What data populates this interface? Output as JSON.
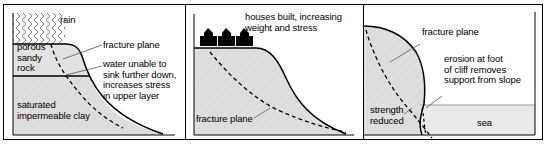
{
  "figure": {
    "panel_count": 3,
    "colors": {
      "rock_fill": "#e0e0e0",
      "clay_fill": "#dddddd",
      "sea_fill": "#e8e8e8",
      "outline": "#000000",
      "house": "#000000",
      "leader_line": "#555555",
      "background": "#ffffff"
    }
  },
  "panel1": {
    "name": "rain-infiltration",
    "labels": {
      "rain": "rain",
      "porous_sandy_rock": "porous\nsandy\nrock",
      "saturated_impermeable_clay": "saturated\nimpermeable clay",
      "fracture_plane": "fracture plane",
      "water_unable": "water unable to\nsink further down,\nincreases stress\nin upper layer"
    }
  },
  "panel2": {
    "name": "houses-loading",
    "labels": {
      "houses_built": "houses built, increasing\nweight and stress",
      "fracture_plane": "fracture plane"
    },
    "house_count": 3
  },
  "panel3": {
    "name": "toe-erosion",
    "labels": {
      "fracture_plane": "fracture plane",
      "erosion": "erosion at foot\nof cliff removes\nsupport from slope",
      "strength_reduced": "strength\nreduced",
      "sea": "sea"
    }
  }
}
